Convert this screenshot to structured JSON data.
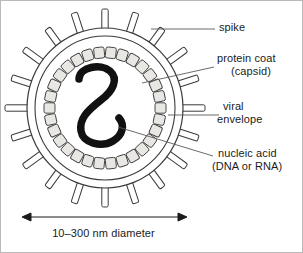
{
  "figure": {
    "labels": {
      "spike": "spike",
      "protein_coat": "protein coat",
      "capsid": "(capsid)",
      "viral": "viral",
      "envelope": "envelope",
      "nucleic_acid": "nucleic acid",
      "dna_or_rna": "(DNA or RNA)",
      "scale": "10–300 nm diameter"
    },
    "parts": {
      "spike_icon": "spike-projection",
      "envelope_icon": "viral-envelope-ring",
      "capsid_icon": "capsid-subunit-ring",
      "nucleic_acid_icon": "nucleic-acid-strand",
      "scale_icon": "double-headed-arrow"
    },
    "colors": {
      "ink": "#1b1b1b",
      "outline": "#3a3a3a",
      "capsid_fill": "#e9e7e4",
      "background": "#ffffff",
      "leader": "#5a5a5a",
      "frame": "#b9b9b9"
    },
    "geometry": {
      "center_x": 104,
      "center_y": 107,
      "envelope_outer_rx": 78,
      "envelope_outer_ry": 80,
      "envelope_inner_rx": 71,
      "envelope_inner_ry": 73,
      "capsid_ring_rx": 56,
      "capsid_ring_ry": 58,
      "spike_count": 20,
      "capsid_subunit_count": 30,
      "scale_arrow_y": 216,
      "scale_arrow_x1": 22,
      "scale_arrow_x2": 185
    }
  }
}
